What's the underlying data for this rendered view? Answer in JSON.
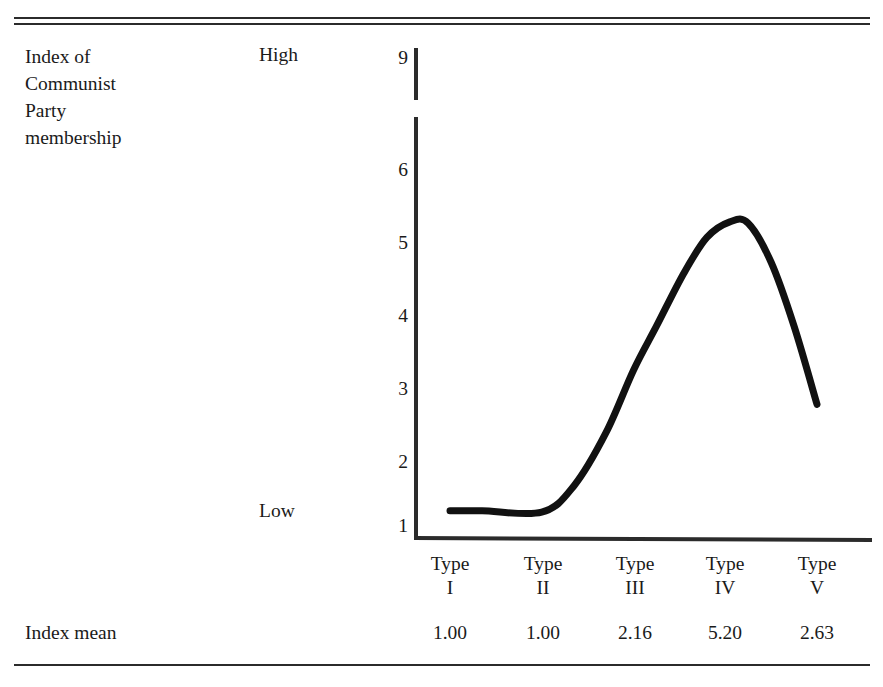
{
  "figure": {
    "row_label_lines": [
      "Index of",
      "Communist",
      "Party",
      "membership"
    ],
    "anchor_high": "High",
    "anchor_low": "Low",
    "footer_label": "Index mean"
  },
  "chart_data": {
    "type": "line",
    "title": "Index of Communist Party membership",
    "xlabel": "",
    "ylabel": "Index of Communist Party membership",
    "categories": [
      "Type I",
      "Type II",
      "Type III",
      "Type IV",
      "Type V"
    ],
    "category_lines": [
      [
        "Type",
        "I"
      ],
      [
        "Type",
        "II"
      ],
      [
        "Type",
        "III"
      ],
      [
        "Type",
        "IV"
      ],
      [
        "Type",
        "V"
      ]
    ],
    "series": [
      {
        "name": "Index mean",
        "values": [
          1.0,
          1.0,
          2.16,
          5.2,
          2.63
        ]
      }
    ],
    "value_labels": [
      "1.00",
      "1.00",
      "2.16",
      "5.20",
      "2.63"
    ],
    "curve_points": [
      {
        "x": 1.0,
        "y": 1.2
      },
      {
        "x": 1.35,
        "y": 1.2
      },
      {
        "x": 2.0,
        "y": 1.18
      },
      {
        "x": 2.35,
        "y": 1.55
      },
      {
        "x": 2.7,
        "y": 2.3
      },
      {
        "x": 3.0,
        "y": 3.18
      },
      {
        "x": 3.25,
        "y": 3.8
      },
      {
        "x": 3.55,
        "y": 4.55
      },
      {
        "x": 3.8,
        "y": 5.05
      },
      {
        "x": 4.05,
        "y": 5.27
      },
      {
        "x": 4.25,
        "y": 5.25
      },
      {
        "x": 4.5,
        "y": 4.7
      },
      {
        "x": 4.75,
        "y": 3.8
      },
      {
        "x": 5.0,
        "y": 2.7
      }
    ],
    "ytick_labels": [
      "9",
      "6",
      "5",
      "4",
      "3",
      "2",
      "1"
    ],
    "ytick_values": [
      9,
      6,
      5,
      4,
      3,
      2,
      1
    ],
    "ylim": [
      1,
      9
    ],
    "axis_break": true,
    "axis_break_between": [
      6.7,
      8.5
    ],
    "grid": false,
    "legend": "none",
    "anchor_high_at": 9,
    "anchor_low_at": 1,
    "line_color": "#111111",
    "axis_color": "#2b2b2b"
  }
}
